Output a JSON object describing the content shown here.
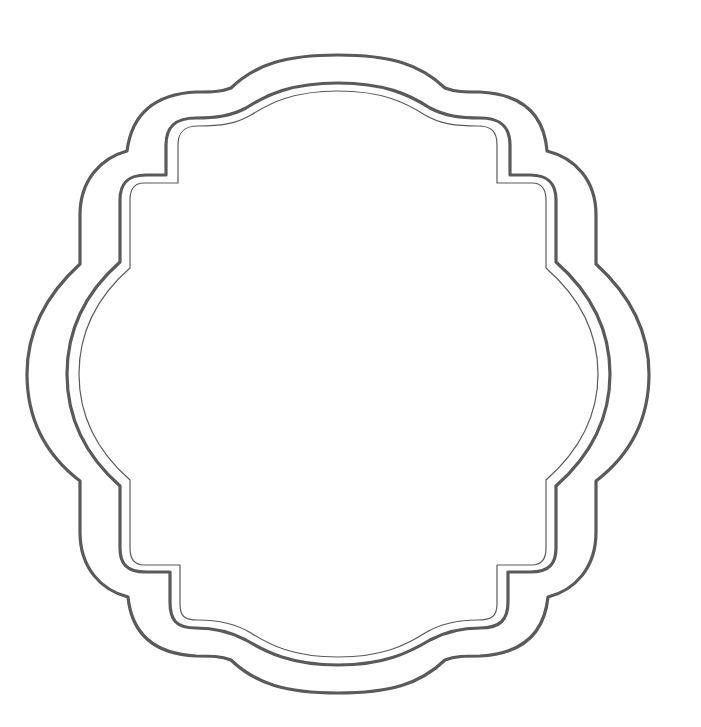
{
  "graphic": {
    "title": "Decorative scalloped frame",
    "background": "#ffffff",
    "stroke_color": "#5a5a5a",
    "center": [
      338,
      374
    ],
    "layers": [
      {
        "name": "outer-border",
        "stroke_width": 3.2,
        "top": 55,
        "bottom": 693,
        "left": 27,
        "right": 649,
        "notch_tl": [
          127,
          151
        ],
        "notch_tr": [
          547,
          151
        ],
        "notch_bl": [
          128,
          597
        ],
        "notch_br": [
          548,
          597
        ],
        "side_notch_top_y": 264,
        "side_notch_bottom_y": 481,
        "side_notch_left_x": 80,
        "side_notch_right_x": 596,
        "top_shoulder_left_x": 226,
        "top_shoulder_right_x": 450,
        "top_shoulder_y": 92,
        "bottom_shoulder_left_x": 226,
        "bottom_shoulder_right_x": 450,
        "bottom_shoulder_y": 656
      },
      {
        "name": "middle-border",
        "stroke_width": 3.2,
        "top": 83,
        "bottom": 665,
        "left": 67,
        "right": 610,
        "corner_tl": [
          166,
          175
        ],
        "corner_tr": [
          510,
          175
        ],
        "corner_bl": [
          170,
          572
        ],
        "corner_br": [
          508,
          572
        ]
      },
      {
        "name": "inner-border",
        "stroke_width": 1.2,
        "top": 91,
        "bottom": 657,
        "left": 79,
        "right": 598,
        "corner_tl": [
          178,
          183
        ],
        "corner_tr": [
          497,
          183
        ],
        "corner_bl": [
          180,
          565
        ],
        "corner_br": [
          497,
          565
        ]
      }
    ]
  }
}
